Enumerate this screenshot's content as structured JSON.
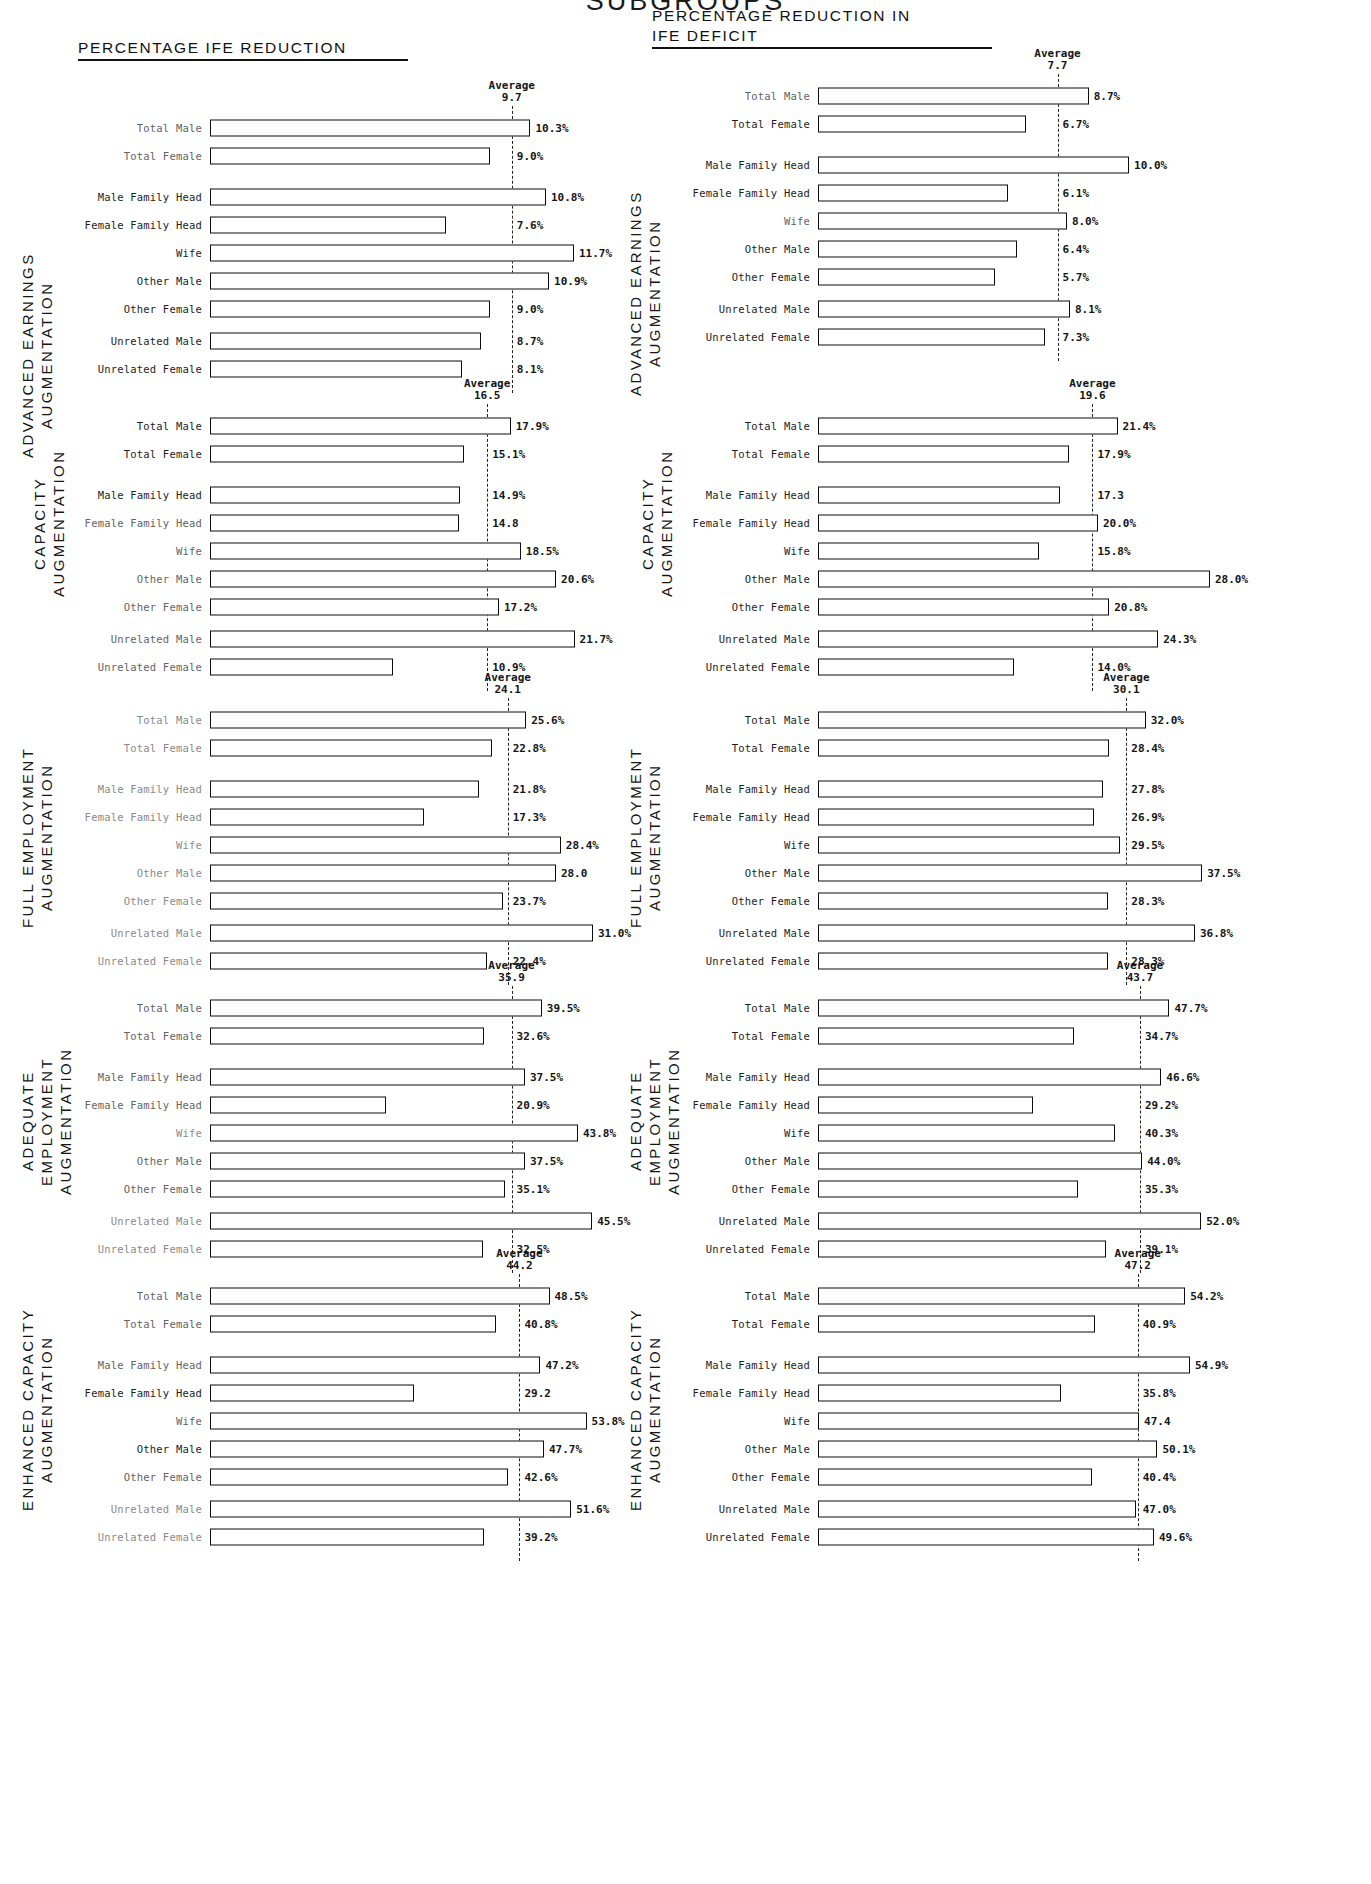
{
  "page": {
    "top_title": "SUBGROUPS",
    "heading_left": "PERCENTAGE IFE REDUCTION",
    "heading_right": "PERCENTAGE REDUCTION IN\nIFE DEFICIT",
    "average_label": "Average"
  },
  "chart_data": {
    "type": "bar",
    "title": "SUBGROUPS",
    "orientation": "horizontal",
    "categories": [
      "Total Male",
      "Total Female",
      "Male Family Head",
      "Female Family Head",
      "Wife",
      "Other Male",
      "Other Female",
      "Unrelated Male",
      "Unrelated Female"
    ],
    "xlabel": "",
    "ylabel": "",
    "grid": false,
    "legend": "none",
    "panels": [
      {
        "column": "PERCENTAGE IFE REDUCTION",
        "row_label": "ADVANCED EARNINGS\nAUGMENTATION",
        "average": 9.7,
        "average_text": "9.7",
        "xmax": 13.5,
        "values": [
          10.3,
          9.0,
          10.8,
          7.6,
          11.7,
          10.9,
          9.0,
          8.7,
          8.1
        ],
        "value_labels": [
          "10.3%",
          "9.0%",
          "10.8%",
          "7.6%",
          "11.7%",
          "10.9%",
          "9.0%",
          "8.7%",
          "8.1%"
        ]
      },
      {
        "column": "PERCENTAGE REDUCTION IN IFE DEFICIT",
        "row_label": "ADVANCED EARNINGS\nAUGMENTATION",
        "average": 7.7,
        "average_text": "7.7",
        "xmax": 13.5,
        "values": [
          8.7,
          6.7,
          10.0,
          6.1,
          8.0,
          6.4,
          5.7,
          8.1,
          7.3
        ],
        "value_labels": [
          "8.7%",
          "6.7%",
          "10.0%",
          "6.1%",
          "8.0%",
          "6.4%",
          "5.7%",
          "8.1%",
          "7.3%"
        ]
      },
      {
        "column": "PERCENTAGE IFE REDUCTION",
        "row_label": "CAPACITY AUGMENTATION",
        "average": 16.5,
        "average_text": "16.5",
        "xmax": 25.0,
        "values": [
          17.9,
          15.1,
          14.9,
          14.8,
          18.5,
          20.6,
          17.2,
          21.7,
          10.9
        ],
        "value_labels": [
          "17.9%",
          "15.1%",
          "14.9%",
          "14.8",
          "18.5%",
          "20.6%",
          "17.2%",
          "21.7%",
          "10.9%"
        ]
      },
      {
        "column": "PERCENTAGE REDUCTION IN IFE DEFICIT",
        "row_label": "CAPACITY AUGMENTATION",
        "average": 19.6,
        "average_text": "19.6",
        "xmax": 30.0,
        "values": [
          21.4,
          17.9,
          17.3,
          20.0,
          15.8,
          28.0,
          20.8,
          24.3,
          14.0
        ],
        "value_labels": [
          "21.4%",
          "17.9%",
          "17.3",
          "20.0%",
          "15.8%",
          "28.0%",
          "20.8%",
          "24.3%",
          "14.0%"
        ]
      },
      {
        "column": "PERCENTAGE IFE REDUCTION",
        "row_label": "FULL EMPLOYMENT\nAUGMENTATION",
        "average": 24.1,
        "average_text": "24.1",
        "xmax": 34.0,
        "values": [
          25.6,
          22.8,
          21.8,
          17.3,
          28.4,
          28.0,
          23.7,
          31.0,
          22.4
        ],
        "value_labels": [
          "25.6%",
          "22.8%",
          "21.8%",
          "17.3%",
          "28.4%",
          "28.0",
          "23.7%",
          "31.0%",
          "22.4%"
        ]
      },
      {
        "column": "PERCENTAGE REDUCTION IN IFE DEFICIT",
        "row_label": "FULL EMPLOYMENT\nAUGMENTATION",
        "average": 30.1,
        "average_text": "30.1",
        "xmax": 41.0,
        "values": [
          32.0,
          28.4,
          27.8,
          26.9,
          29.5,
          37.5,
          28.3,
          36.8,
          28.3
        ],
        "value_labels": [
          "32.0%",
          "28.4%",
          "27.8%",
          "26.9%",
          "29.5%",
          "37.5%",
          "28.3%",
          "36.8%",
          "28.3%"
        ]
      },
      {
        "column": "PERCENTAGE IFE REDUCTION",
        "row_label": "ADEQUATE EMPLOYMENT\nAUGMENTATION",
        "average": 35.9,
        "average_text": "35.9",
        "xmax": 50.0,
        "values": [
          39.5,
          32.6,
          37.5,
          20.9,
          43.8,
          37.5,
          35.1,
          45.5,
          32.5
        ],
        "value_labels": [
          "39.5%",
          "32.6%",
          "37.5%",
          "20.9%",
          "43.8%",
          "37.5%",
          "35.1%",
          "45.5%",
          "32.5%"
        ]
      },
      {
        "column": "PERCENTAGE REDUCTION IN IFE DEFICIT",
        "row_label": "ADEQUATE EMPLOYMENT\nAUGMENTATION",
        "average": 43.7,
        "average_text": "43.7",
        "xmax": 57.0,
        "values": [
          47.7,
          34.7,
          46.6,
          29.2,
          40.3,
          44.0,
          35.3,
          52.0,
          39.1
        ],
        "value_labels": [
          "47.7%",
          "34.7%",
          "46.6%",
          "29.2%",
          "40.3%",
          "44.0%",
          "35.3%",
          "52.0%",
          "39.1%"
        ]
      },
      {
        "column": "PERCENTAGE IFE REDUCTION",
        "row_label": "ENHANCED CAPACITY\nAUGMENTATION",
        "average": 44.2,
        "average_text": "44.2",
        "xmax": 60.0,
        "values": [
          48.5,
          40.8,
          47.2,
          29.2,
          53.8,
          47.7,
          42.6,
          51.6,
          39.2
        ],
        "value_labels": [
          "48.5%",
          "40.8%",
          "47.2%",
          "29.2",
          "53.8%",
          "47.7%",
          "42.6%",
          "51.6%",
          "39.2%"
        ]
      },
      {
        "column": "PERCENTAGE REDUCTION IN IFE DEFICIT",
        "row_label": "ENHANCED CAPACITY\nAUGMENTATION",
        "average": 47.2,
        "average_text": "47.2",
        "xmax": 62.0,
        "values": [
          54.2,
          40.9,
          54.9,
          35.8,
          47.4,
          50.1,
          40.4,
          47.0,
          49.6
        ],
        "value_labels": [
          "54.2%",
          "40.9%",
          "54.9%",
          "35.8%",
          "47.4",
          "50.1%",
          "40.4%",
          "47.0%",
          "49.6%"
        ]
      }
    ]
  },
  "layout": {
    "panel_positions": [
      {
        "left": 0,
        "top": 80,
        "plot_left": 50,
        "plot_width": 420,
        "side_top": 170,
        "side_left": 18
      },
      {
        "left": 608,
        "top": 48,
        "plot_left": 50,
        "plot_width": 420,
        "side_top": 140,
        "side_left": 18
      },
      {
        "left": 0,
        "top": 378,
        "plot_left": 50,
        "plot_width": 420,
        "side_top": 40,
        "side_left": 30
      },
      {
        "left": 608,
        "top": 378,
        "plot_left": 50,
        "plot_width": 420,
        "side_top": 40,
        "side_left": 30
      },
      {
        "left": 0,
        "top": 672,
        "plot_left": 50,
        "plot_width": 420,
        "side_top": 60,
        "side_left": 18
      },
      {
        "left": 608,
        "top": 672,
        "plot_left": 50,
        "plot_width": 420,
        "side_top": 60,
        "side_left": 18
      },
      {
        "left": 0,
        "top": 960,
        "plot_left": 50,
        "plot_width": 420,
        "side_top": 56,
        "side_left": 18
      },
      {
        "left": 608,
        "top": 960,
        "plot_left": 50,
        "plot_width": 420,
        "side_top": 56,
        "side_left": 18
      },
      {
        "left": 0,
        "top": 1248,
        "plot_left": 50,
        "plot_width": 420,
        "side_top": 56,
        "side_left": 18
      },
      {
        "left": 608,
        "top": 1248,
        "plot_left": 50,
        "plot_width": 420,
        "side_top": 56,
        "side_left": 18
      }
    ],
    "row_offsets": [
      0,
      1,
      2.45,
      3.45,
      4.45,
      5.45,
      6.45,
      7.6,
      8.6
    ],
    "fade_classes": [
      [
        "faded",
        "faded",
        "",
        "",
        "",
        "",
        "",
        "",
        ""
      ],
      [
        "faded",
        "",
        "",
        "",
        "faded",
        "",
        "",
        "",
        ""
      ],
      [
        "",
        "",
        "",
        "faded",
        "faded",
        "faded",
        "faded",
        "faded",
        "faded"
      ],
      [
        "",
        "",
        "",
        "",
        "",
        "",
        "",
        "",
        ""
      ],
      [
        "faded2",
        "faded2",
        "faded2",
        "faded2",
        "faded2",
        "faded2",
        "faded2",
        "faded2",
        "faded2"
      ],
      [
        "",
        "",
        "",
        "",
        "",
        "",
        "",
        "",
        ""
      ],
      [
        "faded",
        "faded",
        "faded",
        "faded",
        "faded2",
        "faded",
        "faded",
        "faded2",
        "faded2"
      ],
      [
        "",
        "",
        "",
        "",
        "",
        "",
        "",
        "",
        ""
      ],
      [
        "faded",
        "faded",
        "faded",
        "",
        "faded",
        "",
        "faded",
        "faded2",
        "faded2"
      ],
      [
        "",
        "",
        "",
        "",
        "",
        "",
        "",
        "",
        ""
      ]
    ]
  }
}
